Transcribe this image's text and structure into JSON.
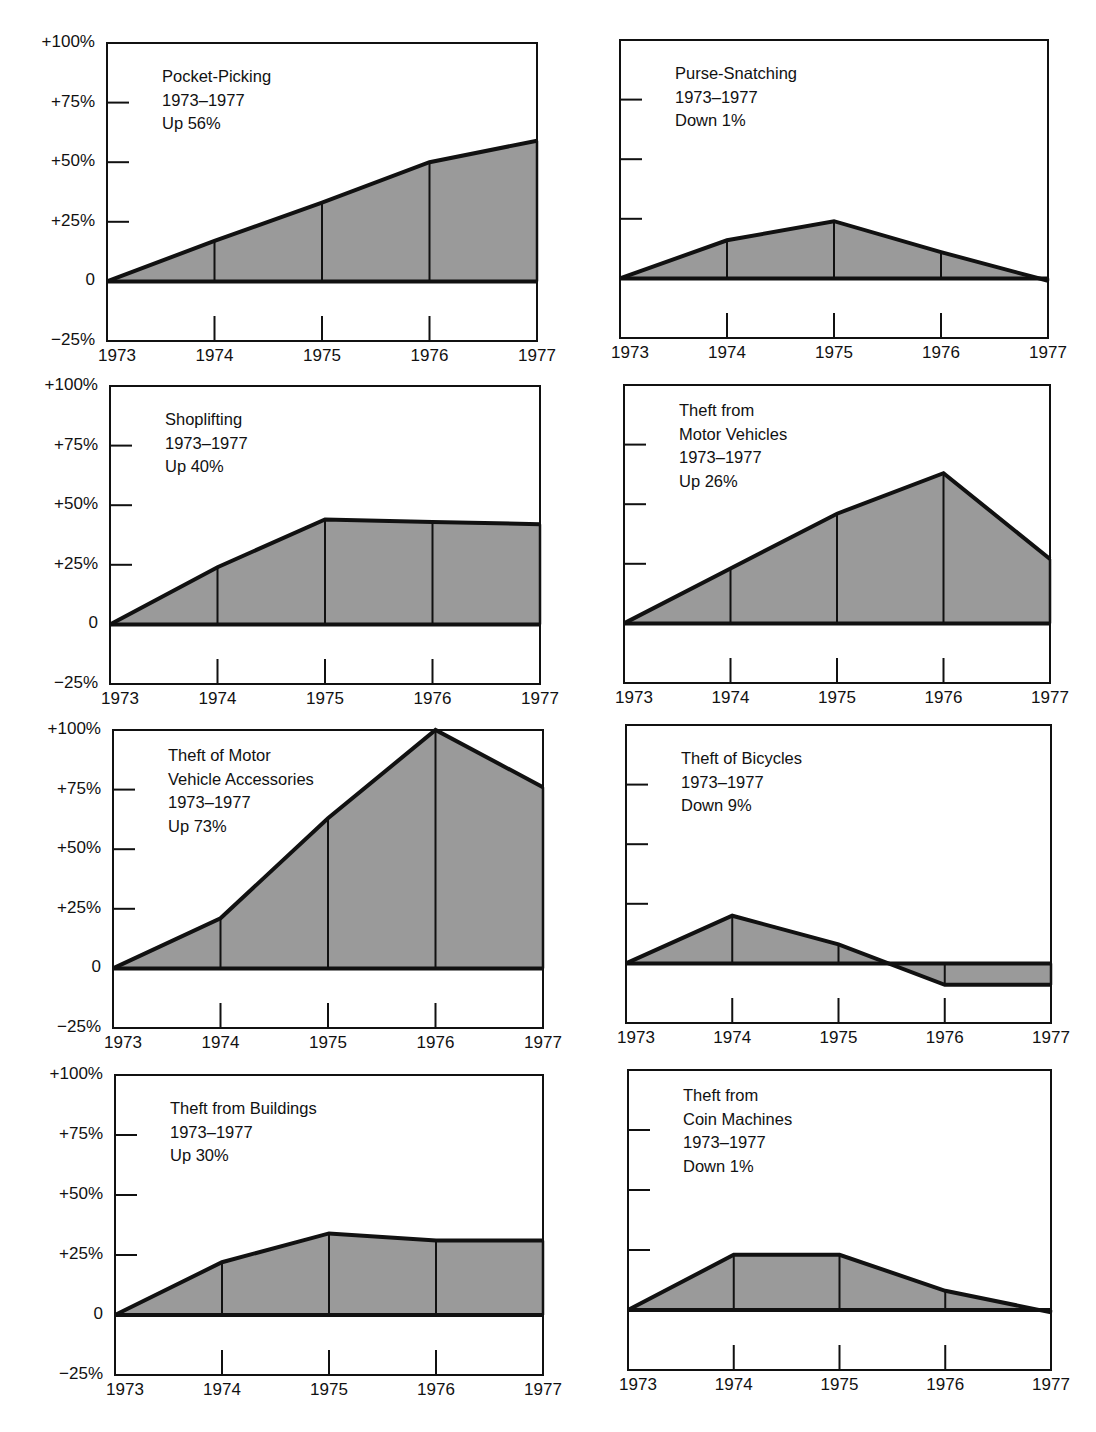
{
  "chart_data": [
    {
      "type": "area",
      "title": "Pocket-Picking",
      "period": "1973–1977",
      "summary": "Up 56%",
      "categories": [
        "1973",
        "1974",
        "1975",
        "1976",
        "1977"
      ],
      "values": [
        0,
        17,
        33,
        50,
        59
      ],
      "ylim": [
        -25,
        100
      ],
      "yticks": [
        "+100%",
        "+75%",
        "+50%",
        "+25%",
        "0",
        "−25%"
      ],
      "xlabel": "",
      "ylabel": "Percent change from 1973"
    },
    {
      "type": "area",
      "title": "Purse-Snatching",
      "period": "1973–1977",
      "summary": "Down 1%",
      "categories": [
        "1973",
        "1974",
        "1975",
        "1976",
        "1977"
      ],
      "values": [
        0,
        16,
        24,
        11,
        -1
      ],
      "ylim": [
        -25,
        100
      ]
    },
    {
      "type": "area",
      "title": "Shoplifting",
      "period": "1973–1977",
      "summary": "Up 40%",
      "categories": [
        "1973",
        "1974",
        "1975",
        "1976",
        "1977"
      ],
      "values": [
        0,
        24,
        44,
        43,
        42
      ],
      "ylim": [
        -25,
        100
      ]
    },
    {
      "type": "area",
      "title": "Theft from Motor Vehicles",
      "period": "1973–1977",
      "summary": "Up 26%",
      "categories": [
        "1973",
        "1974",
        "1975",
        "1976",
        "1977"
      ],
      "values": [
        0,
        23,
        46,
        63,
        27
      ],
      "ylim": [
        -25,
        100
      ]
    },
    {
      "type": "area",
      "title": "Theft of Motor Vehicle Accessories",
      "period": "1973–1977",
      "summary": "Up 73%",
      "categories": [
        "1973",
        "1974",
        "1975",
        "1976",
        "1977"
      ],
      "values": [
        0,
        21,
        63,
        100,
        76
      ],
      "ylim": [
        -25,
        100
      ]
    },
    {
      "type": "area",
      "title": "Theft of Bicycles",
      "period": "1973–1977",
      "summary": "Down 9%",
      "categories": [
        "1973",
        "1974",
        "1975",
        "1976",
        "1977"
      ],
      "values": [
        0,
        20,
        8,
        -9,
        -9
      ],
      "ylim": [
        -25,
        100
      ]
    },
    {
      "type": "area",
      "title": "Theft from Buildings",
      "period": "1973–1977",
      "summary": "Up 30%",
      "categories": [
        "1973",
        "1974",
        "1975",
        "1976",
        "1977"
      ],
      "values": [
        0,
        22,
        34,
        31,
        31
      ],
      "ylim": [
        -25,
        100
      ]
    },
    {
      "type": "area",
      "title": "Theft from Coin Machines",
      "period": "1973–1977",
      "summary": "Down 1%",
      "categories": [
        "1973",
        "1974",
        "1975",
        "1976",
        "1977"
      ],
      "values": [
        0,
        23,
        23,
        8,
        -1
      ],
      "ylim": [
        -25,
        100
      ]
    }
  ],
  "panels": [
    {
      "title_lines": [
        "Pocket-Picking"
      ],
      "period": "1973–1977",
      "summary": "Up 56%"
    },
    {
      "title_lines": [
        "Purse-Snatching"
      ],
      "period": "1973–1977",
      "summary": "Down 1%"
    },
    {
      "title_lines": [
        "Shoplifting"
      ],
      "period": "1973–1977",
      "summary": "Up 40%"
    },
    {
      "title_lines": [
        "Theft from",
        "Motor Vehicles"
      ],
      "period": "1973–1977",
      "summary": "Up 26%"
    },
    {
      "title_lines": [
        "Theft of Motor",
        "Vehicle Accessories"
      ],
      "period": "1973–1977",
      "summary": "Up 73%"
    },
    {
      "title_lines": [
        "Theft of Bicycles"
      ],
      "period": "1973–1977",
      "summary": "Down 9%"
    },
    {
      "title_lines": [
        "Theft from Buildings"
      ],
      "period": "1973–1977",
      "summary": "Up 30%"
    },
    {
      "title_lines": [
        "Theft from",
        "Coin Machines"
      ],
      "period": "1973–1977",
      "summary": "Down 1%"
    }
  ],
  "axis": {
    "y_labels": [
      "+100%",
      "+75%",
      "+50%",
      "+25%",
      "0",
      "−25%"
    ],
    "x_labels": [
      "1973",
      "1974",
      "1975",
      "1976",
      "1977"
    ]
  },
  "colors": {
    "fill": "#9a9a9a",
    "line": "#111111",
    "background": "#ffffff"
  }
}
